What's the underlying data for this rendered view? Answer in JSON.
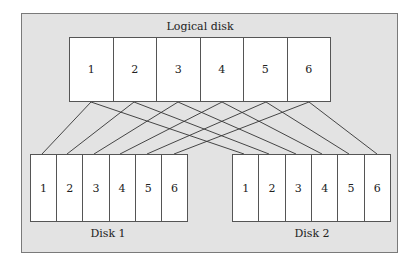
{
  "diagram": {
    "type": "disk-mirroring (RAID 1)",
    "logical_disk": {
      "label": "Logical disk",
      "blocks": [
        "1",
        "2",
        "3",
        "4",
        "5",
        "6"
      ]
    },
    "physical_disks": [
      {
        "label": "Disk 1",
        "blocks": [
          "1",
          "2",
          "3",
          "4",
          "5",
          "6"
        ]
      },
      {
        "label": "Disk 2",
        "blocks": [
          "1",
          "2",
          "3",
          "4",
          "5",
          "6"
        ]
      }
    ],
    "connections": "each logical block maps to the same-numbered block on Disk 1 and Disk 2",
    "colors": {
      "background": "#e3e3e3",
      "block_fill": "#ffffff",
      "border": "#555555",
      "line": "#333333"
    }
  }
}
